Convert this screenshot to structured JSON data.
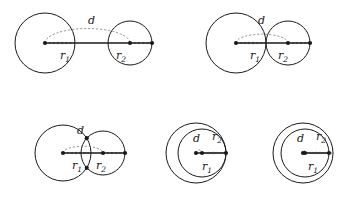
{
  "figure": {
    "type": "geometric-diagram",
    "background_color": "#ffffff",
    "stroke_color": "#1a1a1a",
    "dash_color": "#777777",
    "width": 349,
    "height": 203
  },
  "labels": {
    "d": "d",
    "r1": "r",
    "r1_sub": "1",
    "r2": "r",
    "r2_sub": "2"
  },
  "panels": [
    {
      "id": "panel-separate",
      "name": "two-separate-circles",
      "circle1": {
        "cx": 45,
        "cy": 43,
        "r": 30
      },
      "circle2": {
        "cx": 130,
        "cy": 43,
        "r": 22
      },
      "d_label": {
        "x": 88,
        "y": 24
      },
      "r1_label": {
        "x": 60,
        "y": 59
      },
      "r2_label": {
        "x": 116,
        "y": 59
      }
    },
    {
      "id": "panel-external-tangent",
      "name": "externally-tangent-circles",
      "circle1": {
        "cx": 236,
        "cy": 43,
        "r": 30
      },
      "circle2": {
        "cx": 288,
        "cy": 43,
        "r": 22
      },
      "d_label": {
        "x": 258,
        "y": 24
      },
      "r1_label": {
        "x": 250,
        "y": 59
      },
      "r2_label": {
        "x": 278,
        "y": 59
      }
    },
    {
      "id": "panel-intersecting",
      "name": "intersecting-circles",
      "circle1": {
        "cx": 63,
        "cy": 153,
        "r": 28
      },
      "circle2": {
        "cx": 103,
        "cy": 153,
        "r": 22
      },
      "d_label": {
        "x": 77,
        "y": 134
      },
      "r1_label": {
        "x": 72,
        "y": 169
      },
      "r2_label": {
        "x": 96,
        "y": 169
      }
    },
    {
      "id": "panel-internal-tangent",
      "name": "internally-tangent-circles",
      "circle1": {
        "cx": 196,
        "cy": 153,
        "r": 30
      },
      "circle2": {
        "cx": 202,
        "cy": 153,
        "r": 24
      },
      "d_label": {
        "x": 193,
        "y": 142
      },
      "r1_label": {
        "x": 202,
        "y": 170
      },
      "r2_label": {
        "x": 212,
        "y": 140
      }
    },
    {
      "id": "panel-nested",
      "name": "nested-circles",
      "circle1": {
        "cx": 303,
        "cy": 153,
        "r": 30
      },
      "circle2": {
        "cx": 305,
        "cy": 153,
        "r": 24
      },
      "d_label": {
        "x": 297,
        "y": 142
      },
      "r1_label": {
        "x": 308,
        "y": 170
      },
      "r2_label": {
        "x": 316,
        "y": 140
      }
    }
  ]
}
